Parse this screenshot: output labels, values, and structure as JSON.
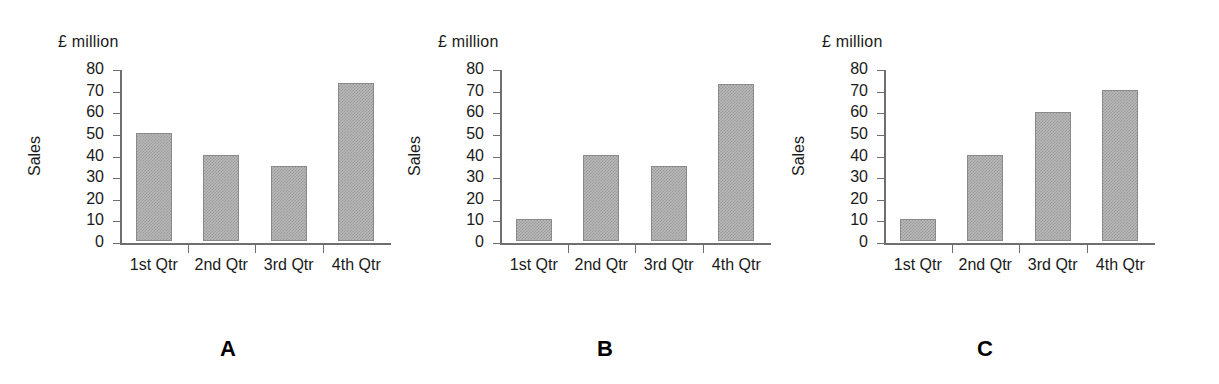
{
  "figure": {
    "panel_letters": [
      "A",
      "B",
      "C"
    ]
  },
  "chart_data": [
    {
      "type": "bar",
      "panel": "A",
      "title": "",
      "unit_note": "£ million",
      "categories": [
        "1st Qtr",
        "2nd Qtr",
        "3rd Qtr",
        "4th Qtr"
      ],
      "values": [
        50,
        40,
        34.5,
        73
      ],
      "xlabel": "",
      "ylabel": "Sales",
      "ylim": [
        0,
        80
      ],
      "yticks": [
        0,
        10,
        20,
        30,
        40,
        50,
        60,
        70,
        80
      ],
      "ytick_labels": [
        "0",
        "10",
        "20",
        "30",
        "40",
        "50",
        "60",
        "70",
        "80"
      ],
      "grid": false,
      "legend": false,
      "bar_color": "#b9b9b9",
      "bar_edge_color": "#8a8a8a"
    },
    {
      "type": "bar",
      "panel": "B",
      "title": "",
      "unit_note": "£ million",
      "categories": [
        "1st Qtr",
        "2nd Qtr",
        "3rd Qtr",
        "4th Qtr"
      ],
      "values": [
        10,
        40,
        34.5,
        72.5
      ],
      "xlabel": "",
      "ylabel": "Sales",
      "ylim": [
        0,
        80
      ],
      "yticks": [
        0,
        10,
        20,
        30,
        40,
        50,
        60,
        70,
        80
      ],
      "ytick_labels": [
        "0",
        "10",
        "20",
        "30",
        "40",
        "50",
        "60",
        "70",
        "80"
      ],
      "grid": false,
      "legend": false,
      "bar_color": "#b9b9b9",
      "bar_edge_color": "#8a8a8a"
    },
    {
      "type": "bar",
      "panel": "C",
      "title": "",
      "unit_note": "£ million",
      "categories": [
        "1st Qtr",
        "2nd Qtr",
        "3rd Qtr",
        "4th Qtr"
      ],
      "values": [
        10,
        40,
        59.5,
        70
      ],
      "xlabel": "",
      "ylabel": "Sales",
      "ylim": [
        0,
        80
      ],
      "yticks": [
        0,
        10,
        20,
        30,
        40,
        50,
        60,
        70,
        80
      ],
      "ytick_labels": [
        "0",
        "10",
        "20",
        "30",
        "40",
        "50",
        "60",
        "70",
        "80"
      ],
      "grid": false,
      "legend": false,
      "bar_color": "#b9b9b9",
      "bar_edge_color": "#8a8a8a"
    }
  ]
}
